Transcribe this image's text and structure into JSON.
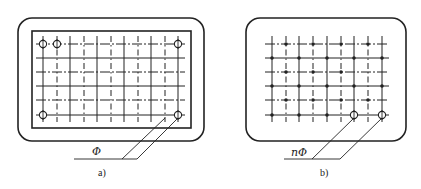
{
  "diagram": {
    "type": "rebar-grid-layout",
    "colors": {
      "line": "#222222",
      "background": "#ffffff"
    },
    "panels": [
      {
        "id": "a",
        "caption": "a)",
        "leader_label": "Φ",
        "frame": {
          "outer": [
            18,
            18,
            186,
            123
          ],
          "outer_radius": 14,
          "inner": [
            32,
            31,
            159,
            97
          ]
        },
        "grid_x": [
          43,
          57,
          70,
          84,
          97,
          111,
          124,
          138,
          151,
          165,
          178
        ],
        "grid_y": [
          44,
          58,
          72,
          86,
          100,
          115
        ],
        "circled_nodes": [
          [
            43,
            44
          ],
          [
            57,
            44
          ],
          [
            178,
            44
          ],
          [
            43,
            115
          ],
          [
            178,
            115
          ]
        ],
        "leader_targets": [
          [
            165,
            115
          ],
          [
            178,
            115
          ]
        ],
        "leader_base": {
          "y": 159,
          "x1": 74,
          "x2": 137,
          "knees": [
            122,
            137
          ]
        },
        "label_pos": [
          92,
          155
        ],
        "caption_pos": [
          98,
          176
        ]
      },
      {
        "id": "b",
        "caption": "b)",
        "leader_label": "nΦ",
        "frame": {
          "outer": [
            246,
            18,
            160,
            123
          ],
          "outer_radius": 14
        },
        "grid_x": [
          272,
          286,
          299,
          313,
          327,
          341,
          354,
          368,
          382
        ],
        "grid_y": [
          44,
          58,
          72,
          86,
          100,
          115
        ],
        "dot_nodes": [
          [
            286,
            44
          ],
          [
            313,
            44
          ],
          [
            341,
            44
          ],
          [
            368,
            44
          ],
          [
            272,
            58
          ],
          [
            299,
            58
          ],
          [
            327,
            58
          ],
          [
            354,
            58
          ],
          [
            382,
            58
          ],
          [
            286,
            72
          ],
          [
            313,
            72
          ],
          [
            341,
            72
          ],
          [
            272,
            86
          ],
          [
            299,
            86
          ],
          [
            327,
            86
          ],
          [
            354,
            86
          ],
          [
            382,
            86
          ],
          [
            286,
            100
          ],
          [
            313,
            100
          ],
          [
            341,
            100
          ],
          [
            368,
            100
          ],
          [
            272,
            115
          ],
          [
            299,
            115
          ],
          [
            327,
            115
          ]
        ],
        "circled_nodes": [
          [
            354,
            115
          ],
          [
            382,
            115
          ]
        ],
        "leader_targets": [
          [
            354,
            115
          ],
          [
            382,
            115
          ]
        ],
        "leader_base": {
          "y": 159,
          "x1": 284,
          "x2": 340,
          "knees": [
            312,
            340
          ]
        },
        "label_pos": [
          291,
          156
        ],
        "caption_pos": [
          320,
          176
        ]
      }
    ]
  }
}
